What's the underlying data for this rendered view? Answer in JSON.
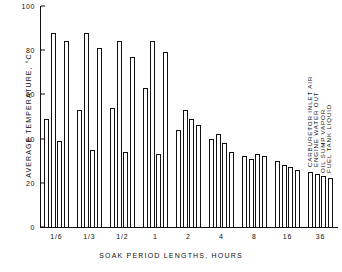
{
  "chart_data": {
    "type": "bar",
    "title": "",
    "xlabel": "SOAK PERIOD LENGTHS, HOURS",
    "ylabel": "AVERAGE TEMPERATURE, °C",
    "ylim": [
      0,
      100
    ],
    "yticks": [
      0,
      20,
      40,
      60,
      80,
      100
    ],
    "ytick_labels": [
      "0",
      "20",
      "40",
      "60",
      "80",
      "100"
    ],
    "grid": false,
    "legend_position": "inside-right-rotated",
    "categories": [
      "1/6",
      "1/3",
      "1/2",
      "1",
      "2",
      "4",
      "8",
      "16",
      "36"
    ],
    "series": [
      {
        "name": "CARBURETOR INLET AIR",
        "values": [
          49,
          53,
          54,
          63,
          44,
          40,
          32,
          30,
          25
        ]
      },
      {
        "name": "ENGINE WATER OUT",
        "values": [
          88,
          88,
          84,
          84,
          53,
          42,
          31,
          28,
          24
        ]
      },
      {
        "name": "OIL SUMP VAPOR",
        "values": [
          39,
          35,
          34,
          33,
          49,
          38,
          33,
          27,
          23
        ]
      },
      {
        "name": "FUEL TANK LIQUID",
        "values": [
          84,
          81,
          77,
          79,
          46,
          34,
          32,
          26,
          22
        ]
      }
    ]
  },
  "axes": {
    "y_title": "AVERAGE TEMPERATURE,  °C",
    "x_title": "SOAK PERIOD LENGTHS, HOURS"
  },
  "legend": {
    "items": [
      "CARBURETOR INLET AIR",
      "ENGINE WATER OUT",
      "OIL SUMP VAPOR",
      "FUEL TANK LIQUID"
    ]
  },
  "colors": {
    "ink": "#111111",
    "bar_fill": "#ffffff",
    "background": "#ffffff"
  }
}
